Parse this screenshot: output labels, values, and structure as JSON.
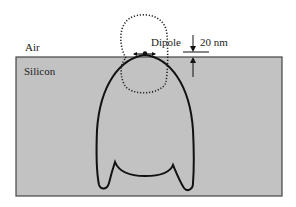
{
  "regions": {
    "air_label": "Air",
    "silicon_label": "Silicon"
  },
  "annotations": {
    "dipole_label": "Dipole",
    "distance_label": "20 nm"
  },
  "colors": {
    "silicon_fill": "#c2c2c2",
    "silicon_border": "#444444",
    "outline": "#111111",
    "dotted_loop": "#222222",
    "background": "#ffffff"
  }
}
